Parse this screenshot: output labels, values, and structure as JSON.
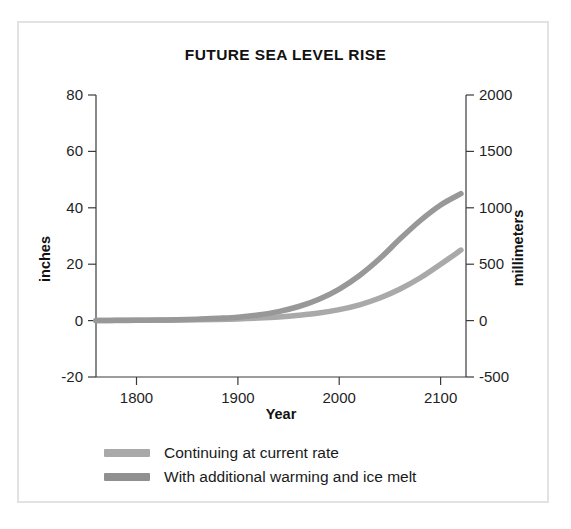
{
  "figure": {
    "border_color": "#e2e2e2",
    "background": "#ffffff"
  },
  "chart_data": {
    "type": "line",
    "title": "FUTURE SEA LEVEL RISE",
    "xlabel": "Year",
    "ylabel": "inches",
    "y2label": "millimeters",
    "xlim": [
      1760,
      2125
    ],
    "ylim": [
      -20,
      80
    ],
    "y2lim": [
      -500,
      2000
    ],
    "xticks": [
      1800,
      1900,
      2000,
      2100
    ],
    "xticklabels": [
      "1800",
      "1900",
      "2000",
      "2100"
    ],
    "yticks": [
      -20,
      0,
      20,
      40,
      60,
      80
    ],
    "yticklabels": [
      "-20",
      "0",
      "20",
      "40",
      "60",
      "80"
    ],
    "y2ticks": [
      -500,
      0,
      500,
      1000,
      1500,
      2000
    ],
    "y2ticklabels": [
      "-500",
      "0",
      "500",
      "1000",
      "1500",
      "2000"
    ],
    "grid": false,
    "legend_position": "below-left",
    "x": [
      1760,
      1780,
      1800,
      1820,
      1840,
      1860,
      1880,
      1900,
      1920,
      1940,
      1960,
      1980,
      2000,
      2020,
      2040,
      2060,
      2080,
      2100,
      2120
    ],
    "series": [
      {
        "name": "Continuing at current rate",
        "color": "#a9a9a9",
        "unit": "inches",
        "values": [
          0.0,
          0.0,
          0.1,
          0.1,
          0.2,
          0.3,
          0.4,
          0.6,
          0.9,
          1.3,
          1.9,
          2.7,
          3.9,
          5.6,
          8.0,
          11.2,
          15.2,
          20.0,
          25.0
        ]
      },
      {
        "name": "With additional warming and ice melt",
        "color": "#989898",
        "unit": "inches",
        "values": [
          0.0,
          0.1,
          0.1,
          0.2,
          0.3,
          0.5,
          0.8,
          1.2,
          2.0,
          3.2,
          5.0,
          7.6,
          11.2,
          16.0,
          22.0,
          29.0,
          35.5,
          41.0,
          45.0
        ]
      }
    ]
  },
  "legend": {
    "items": [
      {
        "label": "Continuing at current rate",
        "color": "#a9a9a9"
      },
      {
        "label": "With additional warming and ice melt",
        "color": "#909090"
      }
    ]
  }
}
